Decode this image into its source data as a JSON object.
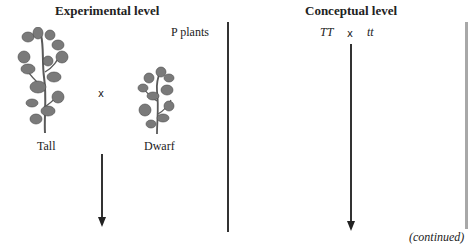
{
  "experimental": {
    "heading": "Experimental level",
    "generation_label": "P plants",
    "cross_symbol": "x",
    "parents": [
      {
        "label": "Tall",
        "icon": "tall-pea-plant-icon"
      },
      {
        "label": "Dwarf",
        "icon": "dwarf-pea-plant-icon"
      }
    ]
  },
  "conceptual": {
    "heading": "Conceptual level",
    "genotype_left": "TT",
    "cross_symbol": "x",
    "genotype_right": "tt"
  },
  "footer": {
    "continued": "(continued)"
  },
  "colors": {
    "line": "#333333",
    "side_bar": "#a8a8a8",
    "plant": "#6e6e6e"
  }
}
